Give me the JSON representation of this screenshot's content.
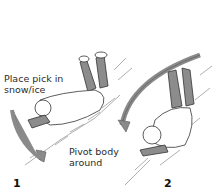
{
  "figure": {
    "panels": [
      {
        "number": "1",
        "callouts": [
          {
            "text_line1": "Place pick in",
            "text_line2": "snow/ice"
          },
          {
            "text_line1": "Pivot body",
            "text_line2": "around"
          }
        ]
      },
      {
        "number": "2"
      }
    ],
    "colors": {
      "arrow": "#8a8a8a",
      "legs": "#8c8c8c",
      "outline": "#333333",
      "snow_hatch": "#9a9a9a"
    }
  }
}
